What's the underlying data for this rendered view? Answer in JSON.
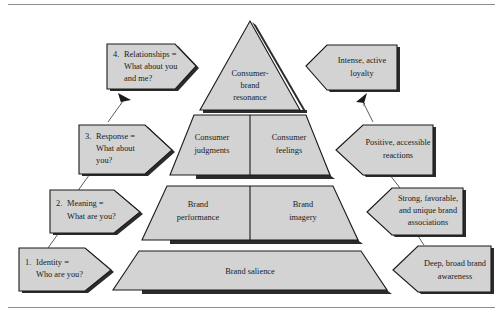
{
  "figure": {
    "colors": {
      "shape_fill": "#d3d3d3",
      "shape_stroke": "#1a1a1a",
      "shadow": "#2b2b2b",
      "rule": "#8d8d8d",
      "background": "#ffffff"
    },
    "rules": {
      "top": "horizontal-rule",
      "bottom": "horizontal-rule"
    }
  },
  "pyramid": {
    "levels": [
      {
        "id": "resonance",
        "shape": "triangle",
        "blocks": [
          {
            "line1": "Consumer-",
            "line2": "brand",
            "line3": "resonance"
          }
        ]
      },
      {
        "id": "response",
        "shape": "trapezoid",
        "blocks": [
          {
            "line1": "Consumer",
            "line2": "judgments"
          },
          {
            "line1": "Consumer",
            "line2": "feelings"
          }
        ]
      },
      {
        "id": "meaning",
        "shape": "trapezoid",
        "blocks": [
          {
            "line1": "Brand",
            "line2": "performance"
          },
          {
            "line1": "Brand",
            "line2": "imagery"
          }
        ]
      },
      {
        "id": "identity",
        "shape": "trapezoid",
        "blocks": [
          {
            "line1": "Brand salience"
          }
        ]
      }
    ]
  },
  "left_steps": [
    {
      "id": "step-4",
      "number": "4.",
      "line1": "Relationships =",
      "line2": "What about you",
      "line3": "and me?"
    },
    {
      "id": "step-3",
      "number": "3.",
      "line1": "Response =",
      "line2": "What about",
      "line3": "you?"
    },
    {
      "id": "step-2",
      "number": "2.",
      "line1": "Meaning =",
      "line2": "What are you?",
      "line3": ""
    },
    {
      "id": "step-1",
      "number": "1.",
      "line1": "Identity =",
      "line2": "Who are you?",
      "line3": ""
    }
  ],
  "right_outcomes": [
    {
      "id": "outcome-resonance",
      "line1": "Intense, active",
      "line2": "loyalty",
      "line3": ""
    },
    {
      "id": "outcome-response",
      "line1": "Positive, accessible",
      "line2": "reactions",
      "line3": ""
    },
    {
      "id": "outcome-meaning",
      "line1": "Strong, favorable,",
      "line2": "and unique brand",
      "line3": "associations"
    },
    {
      "id": "outcome-identity",
      "line1": "Deep, broad brand",
      "line2": "awareness",
      "line3": ""
    }
  ]
}
